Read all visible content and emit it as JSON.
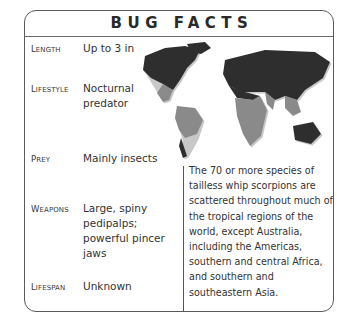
{
  "title": "BUG FACTS",
  "facts": [
    {
      "label_first": "L",
      "label_rest": "ENGTH",
      "value": "Up to 3 in"
    },
    {
      "label_first": "L",
      "label_rest": "IFESTYLE",
      "value": "Nocturnal predator"
    },
    {
      "label_first": "P",
      "label_rest": "REY",
      "value": "Mainly insects"
    },
    {
      "label_first": "W",
      "label_rest": "EAPONS",
      "value": "Large, spiny pedipalps; powerful pincer jaws"
    },
    {
      "label_first": "L",
      "label_rest": "IFESPAN",
      "value": "Unknown"
    }
  ],
  "description": "The 70 or more species of tailless whip scorpions are scattered throughout much of the tropical regions of the world, except Australia, including the Americas, southern and central Africa, and southern and southeastern Asia.",
  "map": {
    "icon": "world-map-icon",
    "colors": {
      "land": "#2e2e2e",
      "range": "#8a8a8a",
      "shadow": "#c8c8c8"
    }
  }
}
